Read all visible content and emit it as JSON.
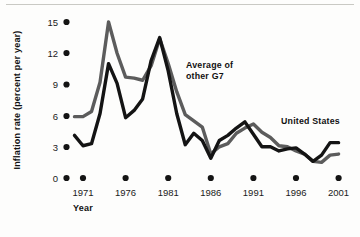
{
  "figure": {
    "background": "#fdfdfc",
    "rule_color": "#c9c9c4"
  },
  "axes": {
    "y_title": "Inflation rate (percent per year)",
    "x_title": "Year",
    "y_ticks": [
      "0",
      "3",
      "6",
      "9",
      "12",
      "15"
    ],
    "x_ticks": [
      "1971",
      "1976",
      "1981",
      "1986",
      "1991",
      "1996",
      "2001"
    ]
  },
  "labels": {
    "g7_line1": "Average of",
    "g7_line2": "other G7",
    "us": "United States"
  },
  "chart_data": {
    "type": "line",
    "title": "",
    "xlabel": "Year",
    "ylabel": "Inflation rate (percent per year)",
    "xlim": [
      1970,
      2002
    ],
    "ylim": [
      0,
      16
    ],
    "yticks": [
      0,
      3,
      6,
      9,
      12,
      15
    ],
    "xticks": [
      1971,
      1976,
      1981,
      1986,
      1991,
      1996,
      2001
    ],
    "grid": false,
    "legend": "inline-annotations",
    "x": [
      1970,
      1971,
      1972,
      1973,
      1974,
      1975,
      1976,
      1977,
      1978,
      1979,
      1980,
      1981,
      1982,
      1983,
      1984,
      1985,
      1986,
      1987,
      1988,
      1989,
      1990,
      1991,
      1992,
      1993,
      1994,
      1995,
      1996,
      1997,
      1998,
      1999,
      2000,
      2001
    ],
    "series": [
      {
        "name": "Average of other G7",
        "color": "#5c5c5c",
        "values": [
          5.9,
          5.9,
          6.4,
          9.2,
          15.0,
          12.0,
          9.7,
          9.6,
          9.4,
          10.8,
          13.4,
          11.0,
          8.3,
          6.1,
          5.5,
          4.9,
          2.3,
          3.0,
          3.3,
          4.3,
          4.8,
          5.2,
          4.4,
          3.9,
          3.1,
          3.0,
          2.6,
          2.3,
          1.6,
          1.5,
          2.2,
          2.3
        ]
      },
      {
        "name": "United States",
        "color": "#141414",
        "values": [
          4.1,
          3.1,
          3.3,
          6.2,
          11.0,
          9.1,
          5.8,
          6.5,
          7.6,
          11.3,
          13.5,
          10.3,
          6.2,
          3.2,
          4.3,
          3.6,
          1.9,
          3.6,
          4.1,
          4.8,
          5.4,
          4.2,
          3.0,
          3.0,
          2.6,
          2.8,
          2.9,
          2.3,
          1.6,
          2.2,
          3.4,
          3.4
        ]
      }
    ],
    "annotations": [
      {
        "text": "Average of other G7",
        "x": 1981.5,
        "y": 9.8
      },
      {
        "text": "United States",
        "x": 1996.5,
        "y": 5.0
      }
    ]
  }
}
